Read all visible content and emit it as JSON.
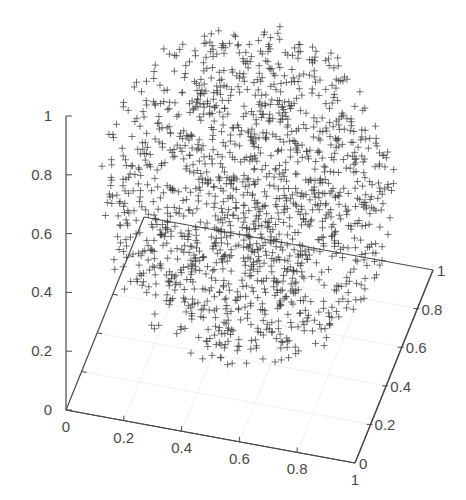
{
  "chart_data": {
    "type": "scatter",
    "subtype": "3d-scatter",
    "title": "",
    "xlabel": "",
    "ylabel": "",
    "zlabel": "",
    "marker": "+",
    "marker_color": "#3a3a3a",
    "axis_color": "#4a4a4a",
    "grid": false,
    "legend": null,
    "xlim": [
      0,
      1
    ],
    "ylim": [
      0,
      1
    ],
    "zlim": [
      0,
      1
    ],
    "x_ticks": [
      "0",
      "0.2",
      "0.4",
      "0.6",
      "0.8",
      "1"
    ],
    "y_ticks": [
      "0",
      "0.2",
      "0.4",
      "0.6",
      "0.8",
      "1"
    ],
    "z_ticks": [
      "0",
      "0.2",
      "0.4",
      "0.6",
      "0.8",
      "1"
    ],
    "series": [
      {
        "name": "points",
        "description": "approx. 1500 points uniformly filling a sphere",
        "distribution": "uniform-ball",
        "center": [
          0.5,
          0.5,
          0.5
        ],
        "radius": 0.5,
        "count": 1500
      }
    ],
    "projection": {
      "origin_px": [
        66,
        410
      ],
      "x_unit_px": [
        289,
        53
      ],
      "y_unit_px": [
        78,
        -193
      ],
      "z_unit_px": [
        0,
        -294
      ]
    }
  }
}
